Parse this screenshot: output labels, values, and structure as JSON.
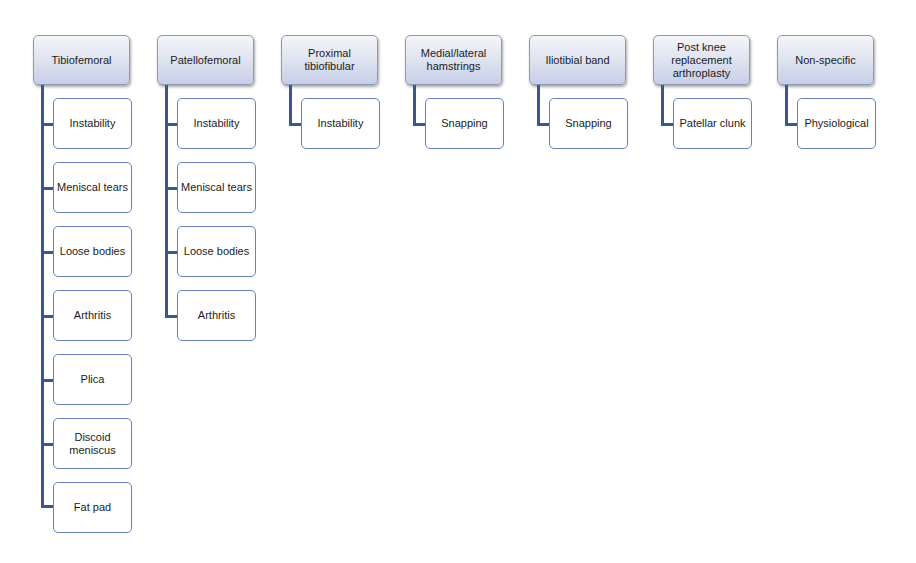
{
  "diagram": {
    "type": "hierarchy",
    "colors": {
      "parent_gradient_top": "#f4f5f9",
      "parent_gradient_bottom": "#c6cfe9",
      "parent_border": "#8f9ab2",
      "child_border": "#6782b6",
      "connector": "#3b5590"
    },
    "categories": [
      {
        "label": "Tibiofemoral",
        "children": [
          "Instability",
          "Meniscal tears",
          "Loose bodies",
          "Arthritis",
          "Plica",
          "Discoid meniscus",
          "Fat pad"
        ]
      },
      {
        "label": "Patellofemoral",
        "children": [
          "Instability",
          "Meniscal tears",
          "Loose bodies",
          "Arthritis"
        ]
      },
      {
        "label": "Proximal tibiofibular",
        "children": [
          "Instability"
        ]
      },
      {
        "label": "Medial/lateral hamstrings",
        "children": [
          "Snapping"
        ]
      },
      {
        "label": "Iliotibial band",
        "children": [
          "Snapping"
        ]
      },
      {
        "label": "Post knee replacement arthroplasty",
        "children": [
          "Patellar clunk"
        ]
      },
      {
        "label": "Non-specific",
        "children": [
          "Physiological"
        ]
      }
    ]
  }
}
